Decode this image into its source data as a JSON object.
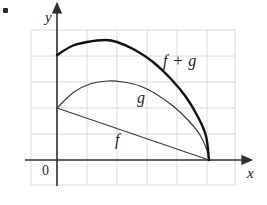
{
  "figure": {
    "background_color": "#ffffff",
    "width": 267,
    "height": 205,
    "corner_mark": "bullet-mark"
  },
  "axes": {
    "y_label": "y",
    "x_label": "x",
    "origin_label": "0",
    "axis_color": "#333333",
    "grid_color": "#d6d6dc",
    "grid": {
      "visible": true,
      "left": 31,
      "right": 235,
      "top": 30,
      "bottom": 185,
      "x_spacing": 30,
      "y_spacing": 26,
      "vertical_lines": [
        31,
        57,
        87,
        117,
        147,
        177,
        207,
        235
      ],
      "horizontal_lines": [
        30,
        56,
        82,
        108,
        134,
        160,
        185
      ]
    },
    "x_axis_y": 160,
    "y_axis_x": 57,
    "x_axis_start": 25,
    "x_axis_end": 247,
    "y_axis_top": 8,
    "y_axis_bottom": 186
  },
  "labels": {
    "curve_fg": "f + g",
    "curve_g": "g",
    "curve_f": "f"
  },
  "chart_data": {
    "type": "line",
    "title": "",
    "xlabel": "x",
    "ylabel": "y",
    "grid": true,
    "legend_position": "inline-annotations",
    "axis_origin_label": "0",
    "xlim": [
      0,
      6.3
    ],
    "ylim": [
      -0.95,
      4.4
    ],
    "common_root_x": 5.07,
    "series": [
      {
        "name": "f + g",
        "label": "f + g",
        "color": "#111111",
        "line_width": 2.4,
        "style": "curve",
        "description": "Concave curve starting high on the y-axis, rising to a maximum then falling steeply to the common root on the x-axis.",
        "points": [
          {
            "x": 0.0,
            "y": 4.04
          },
          {
            "x": 0.5,
            "y": 4.38
          },
          {
            "x": 1.0,
            "y": 4.56
          },
          {
            "x": 1.6,
            "y": 4.62
          },
          {
            "x": 2.0,
            "y": 4.54
          },
          {
            "x": 2.6,
            "y": 4.25
          },
          {
            "x": 3.2,
            "y": 3.79
          },
          {
            "x": 3.8,
            "y": 3.13
          },
          {
            "x": 4.3,
            "y": 2.44
          },
          {
            "x": 4.7,
            "y": 1.66
          },
          {
            "x": 4.95,
            "y": 0.92
          },
          {
            "x": 5.07,
            "y": 0.0
          }
        ],
        "pixel_points": [
          {
            "x": 57,
            "y": 55
          },
          {
            "x": 72,
            "y": 46
          },
          {
            "x": 87,
            "y": 42
          },
          {
            "x": 105,
            "y": 40
          },
          {
            "x": 117,
            "y": 42
          },
          {
            "x": 135,
            "y": 50
          },
          {
            "x": 153,
            "y": 62
          },
          {
            "x": 171,
            "y": 79
          },
          {
            "x": 186,
            "y": 97
          },
          {
            "x": 198,
            "y": 117
          },
          {
            "x": 206,
            "y": 136
          },
          {
            "x": 209,
            "y": 160
          }
        ]
      },
      {
        "name": "g",
        "label": "g",
        "color": "#3a3a3a",
        "line_width": 1.2,
        "style": "curve",
        "description": "Concave curve starting at the same y-intercept as f, rising to a lower maximum then falling to the common root.",
        "points": [
          {
            "x": 0.0,
            "y": 2.0
          },
          {
            "x": 0.55,
            "y": 2.6
          },
          {
            "x": 1.1,
            "y": 2.94
          },
          {
            "x": 1.7,
            "y": 3.06
          },
          {
            "x": 2.2,
            "y": 3.02
          },
          {
            "x": 2.75,
            "y": 2.85
          },
          {
            "x": 3.3,
            "y": 2.54
          },
          {
            "x": 3.85,
            "y": 2.09
          },
          {
            "x": 4.35,
            "y": 1.57
          },
          {
            "x": 4.75,
            "y": 0.98
          },
          {
            "x": 5.0,
            "y": 0.4
          },
          {
            "x": 5.07,
            "y": 0.0
          }
        ],
        "pixel_points": [
          {
            "x": 57,
            "y": 108
          },
          {
            "x": 74,
            "y": 92
          },
          {
            "x": 90,
            "y": 84
          },
          {
            "x": 108,
            "y": 81
          },
          {
            "x": 123,
            "y": 82
          },
          {
            "x": 140,
            "y": 86
          },
          {
            "x": 156,
            "y": 94
          },
          {
            "x": 173,
            "y": 106
          },
          {
            "x": 188,
            "y": 120
          },
          {
            "x": 200,
            "y": 135
          },
          {
            "x": 207,
            "y": 150
          },
          {
            "x": 209,
            "y": 160
          }
        ]
      },
      {
        "name": "f",
        "label": "f",
        "color": "#3a3a3a",
        "line_width": 1.1,
        "style": "straight-line",
        "description": "Straight decreasing line from the shared y-intercept down to the common root on the x-axis.",
        "points": [
          {
            "x": 0.0,
            "y": 2.0
          },
          {
            "x": 5.07,
            "y": 0.0
          }
        ],
        "pixel_points": [
          {
            "x": 57,
            "y": 108
          },
          {
            "x": 209,
            "y": 160
          }
        ]
      }
    ],
    "annotations": [
      {
        "text": "f + g",
        "x_px": 163,
        "y_px": 53
      },
      {
        "text": "g",
        "x_px": 137,
        "y_px": 90
      },
      {
        "text": "f",
        "x_px": 115,
        "y_px": 132
      },
      {
        "text": "0",
        "x_px": 42,
        "y_px": 164
      }
    ]
  }
}
